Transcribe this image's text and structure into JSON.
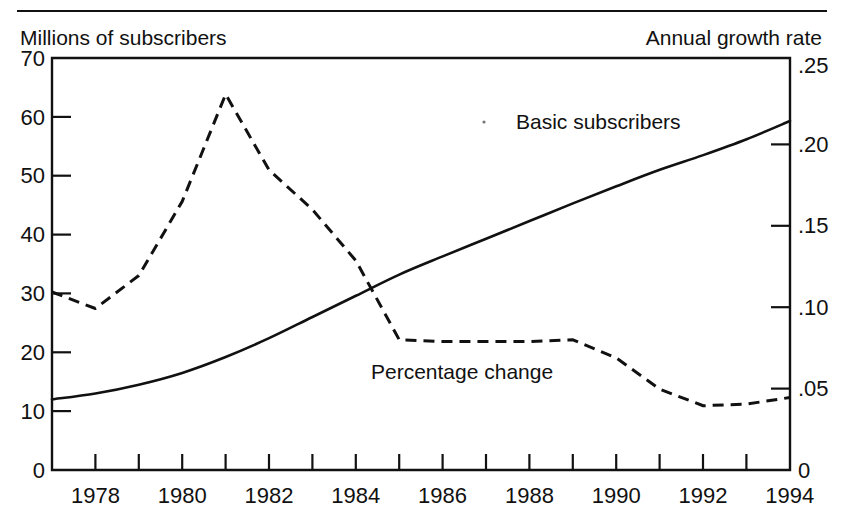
{
  "figure": {
    "top_rule": true,
    "left_axis_title": "Millions of subscribers",
    "right_axis_title": "Annual growth rate"
  },
  "chart_data": {
    "type": "line",
    "title": "",
    "subtitle": "",
    "xlabel": "",
    "ylabel": "Millions of subscribers",
    "y2label": "Annual growth rate",
    "grid": false,
    "legend": "inline-annotations",
    "xlim": [
      1977,
      1994
    ],
    "ylim": [
      0,
      70
    ],
    "y2lim": [
      0,
      0.25
    ],
    "x_tick_values": [
      1977,
      1978,
      1979,
      1980,
      1981,
      1982,
      1983,
      1984,
      1985,
      1986,
      1987,
      1988,
      1989,
      1990,
      1991,
      1992,
      1993,
      1994
    ],
    "x_tick_labels": [
      "",
      "1978",
      "",
      "1980",
      "",
      "1982",
      "",
      "1984",
      "",
      "1986",
      "",
      "1988",
      "",
      "1990",
      "",
      "1992",
      "",
      "1994"
    ],
    "y_tick_values": [
      0,
      10,
      20,
      30,
      40,
      50,
      60,
      70
    ],
    "y_tick_labels": [
      "0",
      "10",
      "20",
      "30",
      "40",
      "50",
      "60",
      "70"
    ],
    "y2_tick_values": [
      0,
      0.05,
      0.1,
      0.15,
      0.2,
      0.25
    ],
    "y2_tick_labels": [
      "0",
      ".05",
      ".10",
      ".15",
      ".20",
      ".25"
    ],
    "x": [
      1977,
      1978,
      1979,
      1980,
      1981,
      1982,
      1983,
      1984,
      1985,
      1986,
      1987,
      1988,
      1989,
      1990,
      1991,
      1992,
      1993,
      1994
    ],
    "series": [
      {
        "name": "Basic subscribers",
        "label": "Basic subscribers",
        "axis": "left",
        "style": "solid",
        "units": "millions",
        "values": [
          12.0,
          13.0,
          14.5,
          16.5,
          19.2,
          22.4,
          26.0,
          29.6,
          33.2,
          36.3,
          39.3,
          42.3,
          45.3,
          48.2,
          51.0,
          53.5,
          56.2,
          59.3
        ]
      },
      {
        "name": "Percentage change",
        "label": "Percentage change",
        "axis": "right",
        "style": "dashed",
        "units": "annual growth rate",
        "values": [
          0.108,
          0.098,
          0.118,
          0.163,
          0.228,
          0.182,
          0.158,
          0.127,
          0.079,
          0.078,
          0.078,
          0.078,
          0.079,
          0.068,
          0.049,
          0.039,
          0.04,
          0.044
        ]
      }
    ],
    "annotations": [
      {
        "text": "Basic subscribers",
        "x": 1988.0,
        "y": 55.0
      },
      {
        "text": "Percentage change",
        "x": 1984.6,
        "y": 18.0
      }
    ]
  }
}
